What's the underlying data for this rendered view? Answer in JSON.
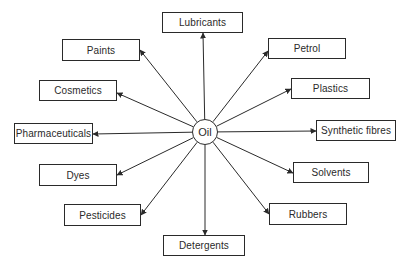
{
  "diagram": {
    "type": "hub-and-spoke",
    "center": {
      "label": "Oil",
      "cx": 205,
      "cy": 132,
      "r": 13
    },
    "arrow_direction": "outward from center",
    "nodes": [
      {
        "id": "lubricants",
        "label": "Lubricants",
        "x": 162,
        "y": 12,
        "w": 81,
        "h": 21,
        "ax": 203,
        "ay": 33
      },
      {
        "id": "paints",
        "label": "Paints",
        "x": 62,
        "y": 39,
        "w": 78,
        "h": 22,
        "ax": 140,
        "ay": 50
      },
      {
        "id": "cosmetics",
        "label": "Cosmetics",
        "x": 39,
        "y": 80,
        "w": 78,
        "h": 21,
        "ax": 117,
        "ay": 93
      },
      {
        "id": "pharmaceuticals",
        "label": "Pharmaceuticals",
        "x": 14,
        "y": 123,
        "w": 79,
        "h": 21,
        "ax": 93,
        "ay": 134
      },
      {
        "id": "dyes",
        "label": "Dyes",
        "x": 39,
        "y": 164,
        "w": 78,
        "h": 22,
        "ax": 117,
        "ay": 175
      },
      {
        "id": "pesticides",
        "label": "Pesticides",
        "x": 64,
        "y": 204,
        "w": 77,
        "h": 22,
        "ax": 141,
        "ay": 215
      },
      {
        "id": "detergents",
        "label": "Detergents",
        "x": 163,
        "y": 235,
        "w": 82,
        "h": 21,
        "ax": 205,
        "ay": 235
      },
      {
        "id": "rubbers",
        "label": "Rubbers",
        "x": 269,
        "y": 203,
        "w": 78,
        "h": 22,
        "ax": 269,
        "ay": 214
      },
      {
        "id": "solvents",
        "label": "Solvents",
        "x": 293,
        "y": 162,
        "w": 76,
        "h": 21,
        "ax": 293,
        "ay": 173
      },
      {
        "id": "synthetic_fibres",
        "label": "Synthetic fibres",
        "x": 316,
        "y": 120,
        "w": 80,
        "h": 21,
        "ax": 316,
        "ay": 131
      },
      {
        "id": "plastics",
        "label": "Plastics",
        "x": 291,
        "y": 78,
        "w": 79,
        "h": 21,
        "ax": 291,
        "ay": 89
      },
      {
        "id": "petrol",
        "label": "Petrol",
        "x": 268,
        "y": 38,
        "w": 78,
        "h": 21,
        "ax": 268,
        "ay": 51
      }
    ],
    "colors": {
      "stroke": "#2a2a2a",
      "background": "#ffffff",
      "text": "#2a2a2a"
    }
  }
}
